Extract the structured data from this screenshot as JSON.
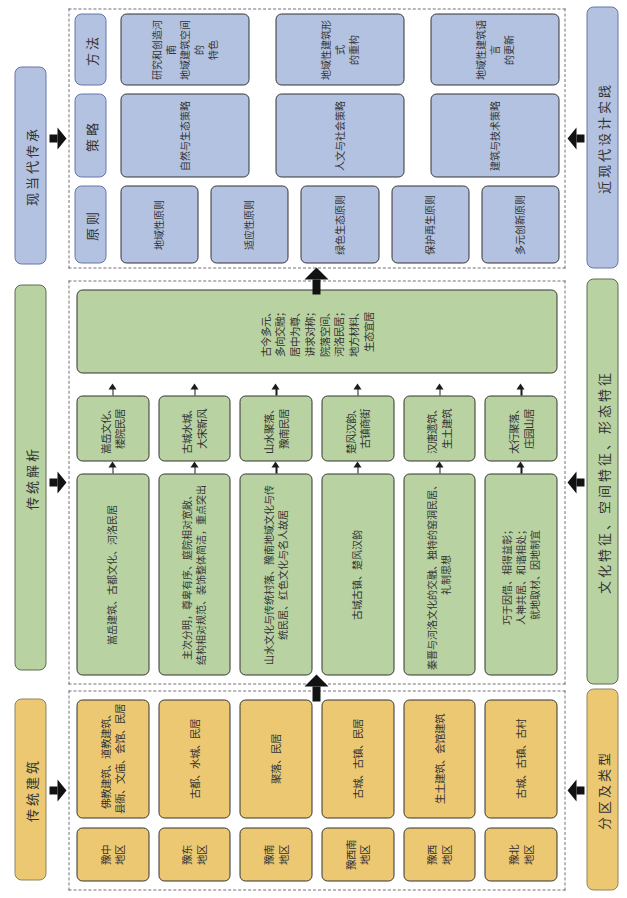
{
  "diagram_title": "河南传统建筑传承分析框图",
  "colors": {
    "yellow_fill": "#ecc873",
    "yellow_border": "#8f8362",
    "green_fill": "#b9d2a2",
    "green_border": "#5c6a52",
    "blue_fill": "#b3c2e0",
    "blue_border": "#6576a6",
    "arrow": "#121212",
    "dashed_border": "#70707b",
    "text": "#333333"
  },
  "sections": [
    {
      "id": "traditional-architecture",
      "title": "传统建筑",
      "footer": "分区及类型",
      "rows": [
        {
          "region": "豫中\n地区",
          "types": "佛教建筑、道教建筑、\n县衙、文庙、会馆、民居"
        },
        {
          "region": "豫东\n地区",
          "types": "古都、水城、民居"
        },
        {
          "region": "豫南\n地区",
          "types": "聚落、民居"
        },
        {
          "region": "豫西南\n地区",
          "types": "古城、古镇、民居"
        },
        {
          "region": "豫西\n地区",
          "types": "生土建筑、会馆建筑"
        },
        {
          "region": "豫北\n地区",
          "types": "古城、古镇、古村"
        }
      ]
    },
    {
      "id": "traditional-analysis",
      "title": "传统解析",
      "footer": "文化特征、空间特征、形态特征",
      "rows": [
        {
          "description": "嵩岳建筑、古都文化、河洛民居",
          "summary": "嵩岳文化、\n楼院民居"
        },
        {
          "description": "主次分明，尊卑有序、庭院相对宽敞、\n结构相对规范、装饰整体简洁，重点突出",
          "summary": "古城水城、\n大宋新风"
        },
        {
          "description": "山水文化与传统村落、豫南地域文化与传\n统民居、红色文化与名人故居",
          "summary": "山水聚落、\n豫南民居"
        },
        {
          "description": "古城古镇、楚风汉韵",
          "summary": "楚风汉韵、\n古镇商街"
        },
        {
          "description": "秦晋与河洛文化的交融、独特的窑洞民居、\n礼制思想",
          "summary": "汉唐遗筑、\n生土建筑"
        },
        {
          "description": "巧于因借、相得益彰；\n人神共居、和谐相处；\n就地取材、因地制宜",
          "summary": "太行聚落、\n庄园山居"
        }
      ],
      "synthesis": "古今多元、\n多向交融；\n居中为尊、\n讲求对称；\n院落空间、\n河洛民居；\n地方材料、\n生态宜居"
    },
    {
      "id": "modern-inheritance",
      "title": "现当代传承",
      "footer": "近现代设计实践",
      "columns": [
        {
          "header": "原则",
          "items": [
            "地域性原则",
            "适应性原则",
            "绿色生态原则",
            "保护再生原则",
            "多元创新原则"
          ]
        },
        {
          "header": "策略",
          "items": [
            "自然与生态策略",
            "人文与社会策略",
            "建筑与技术策略"
          ]
        },
        {
          "header": "方法",
          "items": [
            "研究和创造河南\n地域建筑空间的\n特色",
            "地域性建筑形式\n的重构",
            "地域性建筑语言\n的更新"
          ]
        }
      ]
    }
  ]
}
